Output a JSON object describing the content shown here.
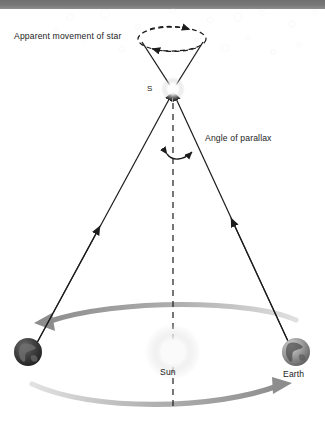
{
  "diagram": {
    "labels": {
      "apparent_movement": "Apparent movement of star",
      "angle_of_parallax": "Angle of parallax",
      "star_marker": "S",
      "sun": "Sun",
      "earth": "Earth"
    },
    "colors": {
      "topbar": "#777777",
      "line": "#1c1c1c",
      "orbit_arrow": "#9a9a9a",
      "background": "#ffffff",
      "star_glow": "#ffffff",
      "sun_glow": "#f2f2f2",
      "earth_left": "#3a3a3a",
      "earth_right": "#8e8e8e",
      "background_star": "#ededed"
    },
    "elements": {
      "apparent_path": "dashed ellipse with two arrowheads",
      "sight_lines": "two solid arrowed lines from each Earth position to star S",
      "baseline": "vertical dashed line from star S through the Sun",
      "parallax_arc": "double-headed arc between dashed baseline and right sight line",
      "orbit_arrows": "two curved grey arrows indicating Earth's orbit"
    }
  },
  "background_stars": [
    {
      "cx": 70,
      "cy": 17,
      "r": 3.2,
      "o": 0.3
    },
    {
      "cx": 105,
      "cy": 14,
      "r": 4.4,
      "o": 0.24
    },
    {
      "cx": 138,
      "cy": 27,
      "r": 2.6,
      "o": 0.3
    },
    {
      "cx": 173,
      "cy": 11,
      "r": 2.2,
      "o": 0.22
    },
    {
      "cx": 210,
      "cy": 20,
      "r": 2.8,
      "o": 0.3
    },
    {
      "cx": 238,
      "cy": 17,
      "r": 4.0,
      "o": 0.26
    },
    {
      "cx": 262,
      "cy": 13,
      "r": 2.4,
      "o": 0.22
    },
    {
      "cx": 292,
      "cy": 24,
      "r": 3.0,
      "o": 0.28
    },
    {
      "cx": 315,
      "cy": 12,
      "r": 2.2,
      "o": 0.22
    },
    {
      "cx": 225,
      "cy": 48,
      "r": 3.4,
      "o": 0.3
    },
    {
      "cx": 273,
      "cy": 52,
      "r": 2.4,
      "o": 0.34
    },
    {
      "cx": 248,
      "cy": 38,
      "r": 2.0,
      "o": 0.22
    },
    {
      "cx": 196,
      "cy": 40,
      "r": 2.0,
      "o": 0.2
    },
    {
      "cx": 122,
      "cy": 49,
      "r": 2.6,
      "o": 0.26
    },
    {
      "cx": 84,
      "cy": 41,
      "r": 2.0,
      "o": 0.2
    },
    {
      "cx": 56,
      "cy": 30,
      "r": 2.2,
      "o": 0.2
    },
    {
      "cx": 160,
      "cy": 57,
      "r": 2.0,
      "o": 0.18
    },
    {
      "cx": 299,
      "cy": 45,
      "r": 2.0,
      "o": 0.22
    }
  ]
}
